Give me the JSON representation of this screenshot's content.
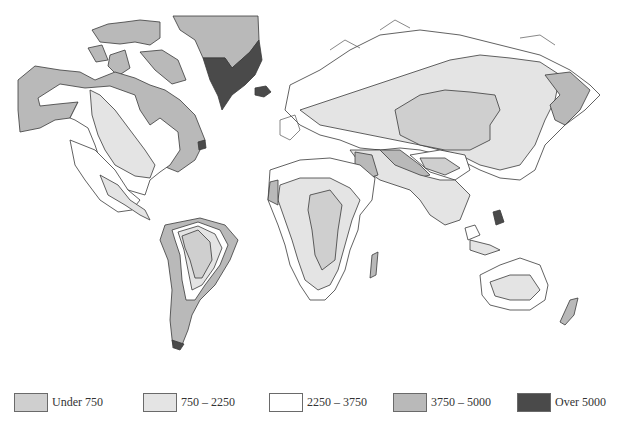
{
  "map": {
    "type": "choropleth",
    "subject": "World map shaded by value bands",
    "legend": [
      {
        "label": "Under 750",
        "color": "#cfcfcf"
      },
      {
        "label": "750 – 2250",
        "color": "#e4e4e4"
      },
      {
        "label": "2250 – 3750",
        "color": "#ffffff"
      },
      {
        "label": "3750 – 5000",
        "color": "#b9b9b9"
      },
      {
        "label": "Over 5000",
        "color": "#4a4a4a"
      }
    ],
    "regions": [
      {
        "name": "Greenland (north)",
        "band": "3750 – 5000"
      },
      {
        "name": "Greenland (south) / Iceland",
        "band": "Over 5000"
      },
      {
        "name": "Arctic Canada / Alaska",
        "band": "3750 – 5000"
      },
      {
        "name": "Central North America",
        "band": "750 – 2250"
      },
      {
        "name": "Siberia / Central Asia",
        "band": "750 – 2250"
      },
      {
        "name": "Central Asian interior",
        "band": "Under 750"
      },
      {
        "name": "Sahara",
        "band": "Under 750"
      },
      {
        "name": "Amazon interior",
        "band": "Under 750"
      },
      {
        "name": "Australia interior",
        "band": "750 – 2250"
      },
      {
        "name": "Kamchatka / Far East",
        "band": "3750 – 5000"
      },
      {
        "name": "Andes / Patagonia",
        "band": "3750 – 5000"
      },
      {
        "name": "New Zealand",
        "band": "3750 – 5000"
      }
    ]
  }
}
